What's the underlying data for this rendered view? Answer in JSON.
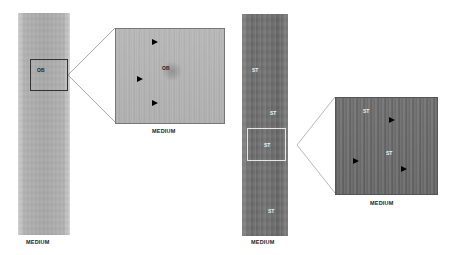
{
  "panels": [
    {
      "id": "left",
      "tone": "light",
      "strip_caption": "MEDIUM",
      "zoom_caption": "MEDIUM",
      "strip_labels": [
        "OB"
      ],
      "zoom_labels": [
        "OB"
      ],
      "arrowhead_count": 3
    },
    {
      "id": "right",
      "tone": "dark",
      "strip_caption": "MEDIUM",
      "zoom_caption": "MEDIUM",
      "strip_labels": [
        "ST",
        "ST",
        "ST",
        "ST"
      ],
      "zoom_labels": [
        "ST",
        "ST"
      ],
      "arrowhead_count": 3
    }
  ]
}
